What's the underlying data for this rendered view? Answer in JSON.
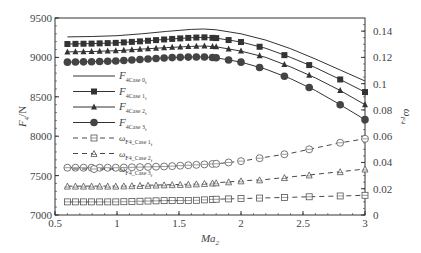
{
  "chart_data": {
    "type": "line",
    "title": "",
    "xlabel": "Ma",
    "xlabel_sub": "2",
    "ylabel": "F",
    "ylabel_sub": "4",
    "ylabel_unit": "/N",
    "y2label": "ω",
    "y2label_sub": "F4",
    "xlim": [
      0.5,
      3
    ],
    "ylim": [
      7000,
      9500
    ],
    "y2lim": [
      0,
      0.15
    ],
    "xticks": [
      "0.5",
      "1",
      "1.5",
      "2",
      "2.5",
      "3"
    ],
    "yticks": [
      "7000",
      "7500",
      "8000",
      "8500",
      "9000",
      "9500"
    ],
    "y2ticks": [
      "0",
      "0.02",
      "0.04",
      "0.06",
      "0.08",
      "0.1",
      "0.12",
      "0.14"
    ],
    "grid": false,
    "legend_position": "upper-left inside",
    "x": [
      0.6,
      0.8,
      1.0,
      1.2,
      1.4,
      1.6,
      1.7,
      1.8,
      2.0,
      2.2,
      2.4,
      2.6,
      2.8,
      3.0
    ],
    "series": [
      {
        "name": "F4Case 0f",
        "legend_main": "F",
        "legend_sub": "4Case 0",
        "legend_subsub": "f",
        "axis": "left",
        "style": "solid",
        "marker": "none",
        "values": [
          9260,
          9265,
          9275,
          9300,
          9330,
          9355,
          9360,
          9350,
          9300,
          9220,
          9110,
          8980,
          8840,
          8700
        ]
      },
      {
        "name": "F4Case 1f",
        "legend_main": "F",
        "legend_sub": "4Case 1",
        "legend_subsub": "f",
        "axis": "left",
        "style": "solid",
        "marker": "square",
        "values": [
          9170,
          9175,
          9185,
          9205,
          9230,
          9250,
          9255,
          9245,
          9195,
          9115,
          9000,
          8870,
          8720,
          8560
        ]
      },
      {
        "name": "F4Case 2f",
        "legend_main": "F",
        "legend_sub": "4Case 2",
        "legend_subsub": "f",
        "axis": "left",
        "style": "solid",
        "marker": "triangle",
        "values": [
          9070,
          9075,
          9085,
          9105,
          9125,
          9140,
          9145,
          9135,
          9080,
          9000,
          8880,
          8740,
          8580,
          8400
        ]
      },
      {
        "name": "F4Case 3f",
        "legend_main": "F",
        "legend_sub": "4Case 3",
        "legend_subsub": "f",
        "axis": "left",
        "style": "solid",
        "marker": "circle",
        "values": [
          8940,
          8945,
          8955,
          8975,
          8995,
          9005,
          9005,
          8995,
          8940,
          8850,
          8730,
          8580,
          8400,
          8210
        ]
      },
      {
        "name": "ωF4_Case 1f",
        "legend_main": "ω",
        "legend_sub": "F4_Case 1",
        "legend_subsub": "f",
        "axis": "right",
        "style": "dashed",
        "marker": "square-open",
        "values": [
          0.01,
          0.01,
          0.01,
          0.0105,
          0.011,
          0.011,
          0.0115,
          0.012,
          0.0125,
          0.013,
          0.0135,
          0.014,
          0.0145,
          0.015
        ]
      },
      {
        "name": "ωF4_Case 2f",
        "legend_main": "ω",
        "legend_sub": "F4_Case 2",
        "legend_subsub": "f",
        "axis": "right",
        "style": "dashed",
        "marker": "triangle-open",
        "values": [
          0.022,
          0.022,
          0.022,
          0.0225,
          0.023,
          0.0235,
          0.024,
          0.0245,
          0.026,
          0.027,
          0.029,
          0.031,
          0.033,
          0.035
        ]
      },
      {
        "name": "ωF4_Case 3f",
        "legend_main": "ω",
        "legend_sub": "F4_Case 3",
        "legend_subsub": "f",
        "axis": "right",
        "style": "dashed",
        "marker": "circle-open",
        "values": [
          0.036,
          0.036,
          0.036,
          0.0365,
          0.037,
          0.038,
          0.0385,
          0.039,
          0.041,
          0.044,
          0.047,
          0.051,
          0.055,
          0.058
        ]
      }
    ]
  }
}
